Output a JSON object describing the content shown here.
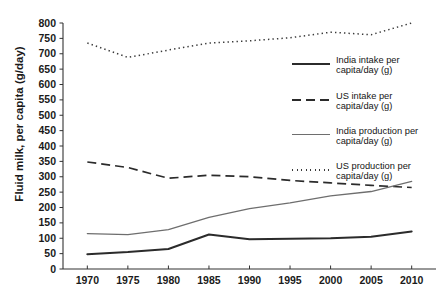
{
  "chart_data": {
    "type": "line",
    "title": "",
    "xlabel": "",
    "ylabel": "Fluid milk, per capita (g/day)",
    "x": [
      1970,
      1975,
      1980,
      1985,
      1990,
      1995,
      2000,
      2005,
      2010
    ],
    "xtick_labels": [
      "1970",
      "1975",
      "1980",
      "1985",
      "1990",
      "1995",
      "2000",
      "2005",
      "2010"
    ],
    "ytick_labels": [
      "0",
      "50",
      "100",
      "150",
      "200",
      "250",
      "300",
      "350",
      "400",
      "450",
      "500",
      "550",
      "600",
      "650",
      "700",
      "750",
      "800"
    ],
    "xlim": [
      1967,
      2013
    ],
    "ylim": [
      0,
      800
    ],
    "ytick_step": 50,
    "grid": false,
    "legend_position": "right-middle",
    "series": [
      {
        "name": "India intake per capita/day (g)",
        "style": "solid-thick",
        "color": "#2b2b2b",
        "values": [
          48,
          55,
          65,
          112,
          97,
          98,
          100,
          105,
          122
        ]
      },
      {
        "name": "US intake per capita/day (g)",
        "style": "dashed",
        "color": "#2b2b2b",
        "values": [
          348,
          330,
          295,
          305,
          300,
          288,
          280,
          272,
          265
        ]
      },
      {
        "name": "India production per capita/day (g)",
        "style": "solid-thin",
        "color": "#6e6e6e",
        "values": [
          115,
          112,
          128,
          168,
          196,
          215,
          238,
          252,
          285
        ]
      },
      {
        "name": "US production per capita/day (g)",
        "style": "dotted",
        "color": "#3a3a3a",
        "values": [
          735,
          688,
          712,
          735,
          742,
          752,
          770,
          762,
          800
        ]
      }
    ]
  },
  "legend": {
    "entries": [
      {
        "label": "India intake per\ncapita/day (g)"
      },
      {
        "label": "US intake per\ncapita/day (g)"
      },
      {
        "label": "India production per\ncapita/day (g)"
      },
      {
        "label": "US production per\ncapita/day (g)"
      }
    ]
  },
  "caption": {
    "text": ""
  }
}
